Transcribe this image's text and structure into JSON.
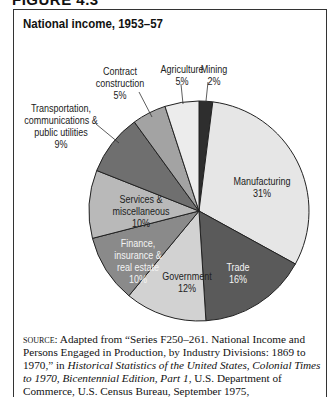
{
  "figure_label": "FIGURE 4.3",
  "chart_data": {
    "type": "pie",
    "title": "National income, 1953–57",
    "start_angle_deg": 0,
    "direction": "clockwise",
    "slices": [
      {
        "label": "Mining",
        "value": 2,
        "display": "2%",
        "color": "#2e2e2e"
      },
      {
        "label": "Manufacturing",
        "value": 31,
        "display": "31%",
        "color": "#e6e6e6"
      },
      {
        "label": "Trade",
        "value": 16,
        "display": "16%",
        "color": "#5a5a5a"
      },
      {
        "label": "Government",
        "value": 12,
        "display": "12%",
        "color": "#d2d2d2"
      },
      {
        "label": "Finance, insurance & real estate",
        "value": 10,
        "display": "10%",
        "color": "#8a8a8a"
      },
      {
        "label": "Services & miscellaneous",
        "value": 10,
        "display": "10%",
        "color": "#b9b9b9"
      },
      {
        "label": "Transportation, communications & public utilities",
        "value": 9,
        "display": "9%",
        "color": "#6f6f6f"
      },
      {
        "label": "Contract construction",
        "value": 5,
        "display": "5%",
        "color": "#a3a3a3"
      },
      {
        "label": "Agriculture",
        "value": 5,
        "display": "5%",
        "color": "#ececec"
      }
    ]
  },
  "labels": {
    "mining": {
      "name": "Mining",
      "pct": "2%"
    },
    "agriculture": {
      "name": "Agriculture",
      "pct": "5%"
    },
    "contract": {
      "line1": "Contract",
      "line2": "construction",
      "pct": "5%"
    },
    "transport": {
      "line1": "Transportation,",
      "line2": "communications &",
      "line3": "public utilities",
      "pct": "9%"
    },
    "manufacturing": {
      "name": "Manufacturing",
      "pct": "31%"
    },
    "services": {
      "line1": "Services &",
      "line2": "miscellaneous",
      "pct": "10%"
    },
    "finance": {
      "line1": "Finance,",
      "line2": "insurance &",
      "line3": "real estate",
      "pct": "10%"
    },
    "government": {
      "name": "Government",
      "pct": "12%"
    },
    "trade": {
      "name": "Trade",
      "pct": "16%"
    }
  },
  "source": {
    "prefix": "source:",
    "text1": " Adapted from “Series F250–261. National Income and Persons Engaged in Production, by Industry Divisions: 1869 to 1970,” in ",
    "italic1": "Historical Statistics of the United States, Colonial Times to 1970, Bicentennial Edition, Part 1",
    "text2": ", U.S. Department of Commerce, U.S. Census Bureau, September 1975, http://www2.census.gov/prod2/"
  }
}
